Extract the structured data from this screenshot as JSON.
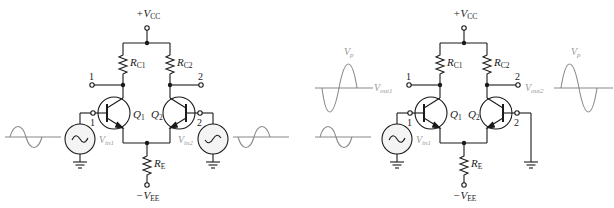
{
  "colors": {
    "wire": "#1a1a1a",
    "signal": "#8a8a8a",
    "background": "#ffffff"
  },
  "circuits": [
    {
      "id": "left",
      "title": "Differential amplifier with two input sources",
      "labels": {
        "vcc_sign": "+V",
        "vcc_sub": "CC",
        "vee_sign": "−V",
        "vee_sub": "EE",
        "rc1": "R",
        "rc1_sub": "C1",
        "rc2": "R",
        "rc2_sub": "C2",
        "re": "R",
        "re_sub": "E",
        "q1": "Q",
        "q1_sub": "1",
        "q2": "Q",
        "q2_sub": "2",
        "out1": "1",
        "out2": "2",
        "in1": "1",
        "in2": "2",
        "vin1": "V",
        "vin1_sub": "in1",
        "vin2": "V",
        "vin2_sub": "in2"
      }
    },
    {
      "id": "right",
      "title": "Differential amplifier single-ended input, input 2 grounded",
      "labels": {
        "vcc_sign": "+V",
        "vcc_sub": "CC",
        "vee_sign": "−V",
        "vee_sub": "EE",
        "rc1": "R",
        "rc1_sub": "C1",
        "rc2": "R",
        "rc2_sub": "C2",
        "re": "R",
        "re_sub": "E",
        "q1": "Q",
        "q1_sub": "1",
        "q2": "Q",
        "q2_sub": "2",
        "out1": "1",
        "out2": "2",
        "in1": "1",
        "in2": "2",
        "vin1": "V",
        "vin1_sub": "in1",
        "vout1": "V",
        "vout1_sub": "out1",
        "vout2": "V",
        "vout2_sub": "out2",
        "vp1": "V",
        "vp1_sub": "p",
        "vp2": "V",
        "vp2_sub": "p"
      }
    }
  ]
}
